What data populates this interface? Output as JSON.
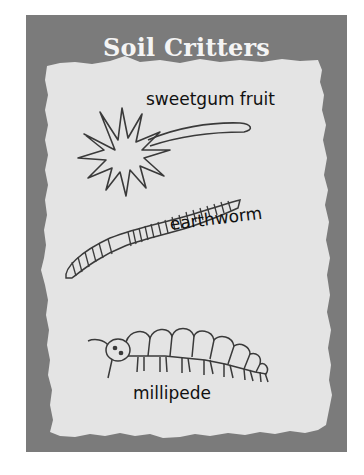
{
  "title": "Soil Critters",
  "colors": {
    "frame": "#7b7b7b",
    "paper": "#e4e4e4",
    "ink": "#333333",
    "title_text": "#f4f4f4"
  },
  "critters": [
    {
      "name": "sweetgum fruit",
      "icon": "spiky-ball-icon"
    },
    {
      "name": "earthworm",
      "icon": "worm-icon"
    },
    {
      "name": "millipede",
      "icon": "millipede-icon"
    }
  ]
}
